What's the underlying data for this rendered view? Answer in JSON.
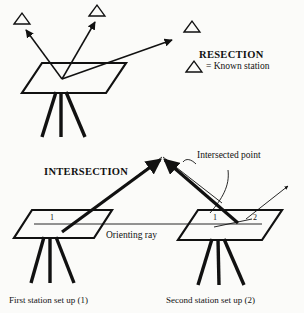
{
  "figure": {
    "background_color": "#fbfbf9",
    "ink_color": "#111111",
    "width": 304,
    "height": 313
  },
  "resection": {
    "title": "RESECTION",
    "legend": {
      "symbol_name": "known-station-triangle",
      "text": "= Known station"
    },
    "known_stations": [
      {
        "id": "station-left",
        "x": 22,
        "y": 18
      },
      {
        "id": "station-middle",
        "x": 97,
        "y": 10
      },
      {
        "id": "station-right",
        "x": 192,
        "y": 27
      }
    ],
    "ray_count": 3,
    "table": {
      "id": "plane-table-resection",
      "legs": 3
    }
  },
  "intersection": {
    "title": "INTERSECTION",
    "intersected_point_label": "Intersected point",
    "orienting_ray_label": "Orienting ray",
    "stations": [
      {
        "id": "first-station",
        "caption": "First station set up (1)",
        "point_labels": [
          "1"
        ],
        "legs": 3
      },
      {
        "id": "second-station",
        "caption": "Second station set up (2)",
        "point_labels": [
          "1",
          "2"
        ],
        "legs": 3
      }
    ]
  }
}
